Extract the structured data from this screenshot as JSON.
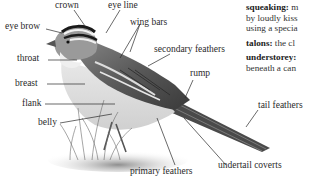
{
  "illustration": {
    "subject": "bird-anatomy",
    "labels": {
      "crown": "crown",
      "eye_line": "eye line",
      "eye_brow": "eye brow",
      "wing_bars": "wing bars",
      "throat": "throat",
      "secondary_feathers": "secondary feathers",
      "rump": "rump",
      "breast": "breast",
      "flank": "flank",
      "belly": "belly",
      "tail_feathers": "tail feathers",
      "undertail_coverts": "undertail coverts",
      "primary_feathers": "primary feathers"
    }
  },
  "glossary": {
    "entries": [
      {
        "term": "squeaking:",
        "lines": [
          "m",
          "by loudly kiss",
          "using a specia"
        ]
      },
      {
        "term": "talons:",
        "lines": [
          "the cl"
        ]
      },
      {
        "term": "understorey:",
        "lines": [
          "",
          "beneath a can"
        ]
      }
    ]
  }
}
